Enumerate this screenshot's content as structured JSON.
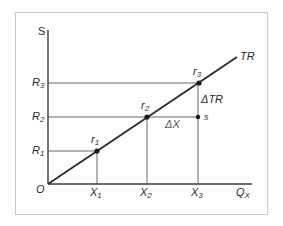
{
  "diagram": {
    "type": "total-revenue-line",
    "axes": {
      "y_label": "S",
      "x_label": "Q",
      "x_label_sub": "X",
      "origin_label": "O"
    },
    "line_label": "TR",
    "points": [
      {
        "name": "r",
        "sub": "1",
        "y_tick": "R",
        "y_tick_sub": "1",
        "x_tick": "X",
        "x_tick_sub": "1"
      },
      {
        "name": "r",
        "sub": "2",
        "y_tick": "R",
        "y_tick_sub": "2",
        "x_tick": "X",
        "x_tick_sub": "2"
      },
      {
        "name": "r",
        "sub": "3",
        "y_tick": "R",
        "y_tick_sub": "3",
        "x_tick": "X",
        "x_tick_sub": "3"
      }
    ],
    "extra_point": "s",
    "delta_x_label": "ΔX",
    "delta_tr_label": "ΔTR"
  },
  "colors": {
    "frame": "#c8c8c8",
    "lines": "#3a3a3a",
    "text": "#2a2a2a"
  }
}
